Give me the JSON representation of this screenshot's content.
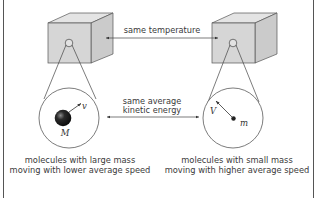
{
  "diagram": {
    "type": "kinetic-theory-comparison",
    "colors": {
      "frame": "#555555",
      "cube_front": "#d6d6d6",
      "cube_top": "#e4e4e4",
      "cube_side": "#c9c9c9",
      "line": "#444444",
      "text": "#3a3a3a"
    },
    "connectors": {
      "temperature": {
        "label": "same temperature"
      },
      "energy": {
        "line1": "same average",
        "line2": "kinetic energy"
      }
    },
    "left": {
      "name": "large-mass-container",
      "molecule_mass_label": "M",
      "velocity_label": "v",
      "caption_line1": "molecules with large mass",
      "caption_line2": "moving with lower average speed"
    },
    "right": {
      "name": "small-mass-container",
      "molecule_mass_label": "m",
      "velocity_label": "V",
      "caption_line1": "molecules with small mass",
      "caption_line2": "moving with higher average speed"
    }
  }
}
